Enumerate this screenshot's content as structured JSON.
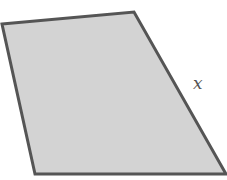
{
  "diagram": {
    "shape": "quadrilateral",
    "vertices": [
      [
        2,
        24
      ],
      [
        134,
        12
      ],
      [
        226,
        174
      ],
      [
        35,
        174
      ]
    ],
    "fill_color": "#d3d3d3",
    "stroke_color": "#555555",
    "side_label": {
      "text": "x",
      "side": "right",
      "position": [
        198,
        88
      ]
    }
  }
}
